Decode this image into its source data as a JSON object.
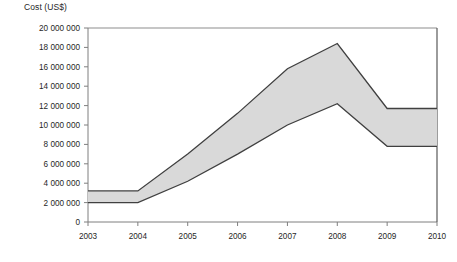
{
  "chart_data": {
    "type": "area",
    "title": "",
    "xlabel": "",
    "ylabel": "Cost (US$)",
    "x": [
      2003,
      2004,
      2005,
      2006,
      2007,
      2008,
      2009,
      2010
    ],
    "xtick_labels": [
      "2003",
      "2004",
      "2005",
      "2006",
      "2007",
      "2008",
      "2009",
      "2010"
    ],
    "xlim": [
      2003,
      2010
    ],
    "ylim": [
      0,
      20000000
    ],
    "ytick_values": [
      0,
      2000000,
      4000000,
      6000000,
      8000000,
      10000000,
      12000000,
      14000000,
      16000000,
      18000000,
      20000000
    ],
    "ytick_labels": [
      "0",
      "2 000 000",
      "4 000 000",
      "6 000 000",
      "8 000 000",
      "10 000 000",
      "12 000 000",
      "14 000 000",
      "16 000 000",
      "18 000 000",
      "20 000 000"
    ],
    "grid": false,
    "legend": false,
    "band_fill_color": "#d9d9d9",
    "band_line_color": "#404040",
    "axis_color": "#7f7f7f",
    "series": [
      {
        "name": "Upper bound",
        "values": [
          3200000,
          3200000,
          7000000,
          11200000,
          15800000,
          18400000,
          11700000,
          11700000
        ]
      },
      {
        "name": "Lower bound",
        "values": [
          2000000,
          2000000,
          4200000,
          7000000,
          10000000,
          12200000,
          7800000,
          7800000
        ]
      }
    ]
  }
}
